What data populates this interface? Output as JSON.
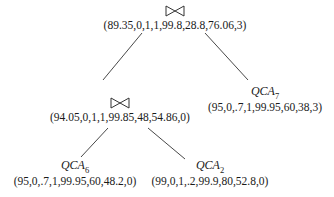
{
  "tree": {
    "root": {
      "type": "join",
      "symbol": "⋈",
      "values": "(89.35,0,1,1,99.8,28.8,76.06,3)"
    },
    "inner_join": {
      "type": "join",
      "symbol": "⋈",
      "values": "(94.05,0,1,1,99.85,48,54.86,0)"
    },
    "qca7": {
      "type": "service",
      "name": "QCA",
      "index": "7",
      "values": "(95,0,.7,1,99.95,60,38,3)"
    },
    "qca6": {
      "type": "service",
      "name": "QCA",
      "index": "6",
      "values": "(95,0,.7,1,99.95,60,48.2,0)"
    },
    "qca2": {
      "type": "service",
      "name": "QCA",
      "index": "2",
      "values": "(99,0,1,.2,99.9,80,52.8,0)"
    }
  },
  "edges": [
    [
      "root",
      "inner_join"
    ],
    [
      "root",
      "qca7"
    ],
    [
      "inner_join",
      "qca6"
    ],
    [
      "inner_join",
      "qca2"
    ]
  ]
}
